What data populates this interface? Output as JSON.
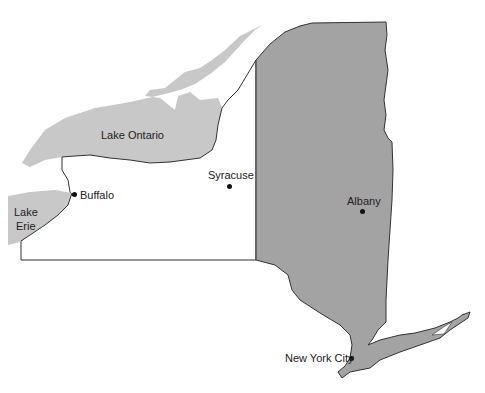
{
  "map": {
    "title": "New York State",
    "colors": {
      "region": "#a3a3a3",
      "lake": "#c8c8c8",
      "outline": "#333333",
      "background": "#ffffff"
    },
    "lakes": [
      {
        "name": "Lake Ontario",
        "label_lines": [
          "Lake Ontario"
        ]
      },
      {
        "name": "Lake Erie",
        "label_lines": [
          "Lake",
          "Erie"
        ]
      }
    ],
    "cities": [
      {
        "name": "Buffalo",
        "x": 74,
        "y": 194
      },
      {
        "name": "Syracuse",
        "x": 229,
        "y": 186
      },
      {
        "name": "Albany",
        "x": 362,
        "y": 211
      },
      {
        "name": "New York City",
        "x": 351,
        "y": 358
      }
    ]
  }
}
